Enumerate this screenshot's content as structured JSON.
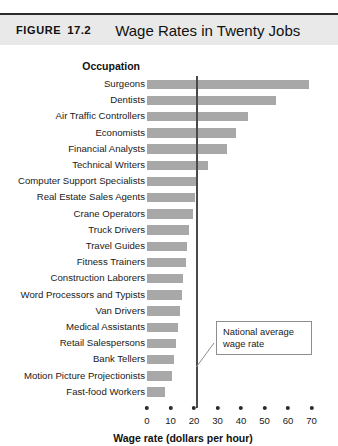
{
  "figure": {
    "label": "FIGURE",
    "number": "17.2",
    "title": "Wage Rates in Twenty Jobs"
  },
  "annotation": {
    "text": "National average\nwage rate"
  },
  "chart_data": {
    "type": "bar",
    "orientation": "horizontal",
    "title": "Wage Rates in Twenty Jobs",
    "xlabel": "Wage rate (dollars per hour)",
    "ylabel": "Occupation",
    "xlim": [
      0,
      72
    ],
    "xticks": [
      0,
      10,
      20,
      30,
      40,
      50,
      60,
      70
    ],
    "xtick_labels": [
      "0",
      "10",
      "20",
      "30",
      "40",
      "50",
      "60",
      "70"
    ],
    "grid": false,
    "legend": null,
    "bar_color": "#a8a8a8",
    "categories": [
      "Surgeons",
      "Dentists",
      "Air Traffic Controllers",
      "Economists",
      "Financial Analysts",
      "Technical Writers",
      "Computer Support Specialists",
      "Real Estate Sales Agents",
      "Crane Operators",
      "Truck Drivers",
      "Travel Guides",
      "Fitness Trainers",
      "Construction Laborers",
      "Word Processors and Typists",
      "Van Drivers",
      "Medical Assistants",
      "Retail Salespersons",
      "Bank Tellers",
      "Motion Picture Projectionists",
      "Fast-food Workers"
    ],
    "values": [
      69,
      55,
      43,
      38,
      34,
      26,
      21.5,
      20.5,
      19.5,
      18,
      17,
      16.5,
      15.5,
      15,
      14,
      13,
      12.5,
      11.5,
      10.5,
      7.5
    ],
    "annotations": [
      {
        "type": "vline",
        "value": 21,
        "label": "National average wage rate",
        "color": "#4a4a4a"
      }
    ]
  }
}
